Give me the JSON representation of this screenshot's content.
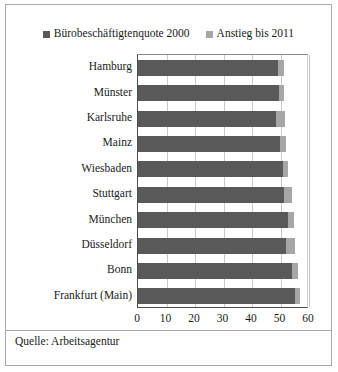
{
  "chart_data": {
    "type": "bar",
    "orientation": "horizontal",
    "stacked": true,
    "title": "",
    "xlabel": "",
    "ylabel": "",
    "xlim": [
      0,
      60
    ],
    "xticks": [
      0,
      10,
      20,
      30,
      40,
      50,
      60
    ],
    "xtick_labels": [
      "0",
      "10",
      "20",
      "30",
      "40",
      "50",
      "60"
    ],
    "grid": true,
    "grid_axis": "x",
    "legend_position": "top-center",
    "categories": [
      "Hamburg",
      "Münster",
      "Karlsruhe",
      "Mainz",
      "Wiesbaden",
      "Stuttgart",
      "München",
      "Düsseldorf",
      "Bonn",
      "Frankfurt (Main)"
    ],
    "series": [
      {
        "name": "Bürobeschäftigtenquote 2000",
        "color": "#595959",
        "values": [
          49.1,
          49.5,
          48.4,
          49.8,
          50.9,
          51.2,
          52.6,
          51.9,
          54.0,
          55.1
        ]
      },
      {
        "name": "Anstieg bis 2011",
        "color": "#a6a6a6",
        "values": [
          2.1,
          1.8,
          3.2,
          2.1,
          1.8,
          2.8,
          2.1,
          3.2,
          2.1,
          1.8
        ]
      }
    ],
    "totals": [
      51.2,
      51.3,
      51.6,
      51.9,
      52.7,
      54.0,
      54.7,
      55.1,
      56.1,
      56.9
    ]
  },
  "legend": {
    "items": [
      {
        "label": "Bürobeschäftigtenquote 2000",
        "swatch_color": "#595959"
      },
      {
        "label": "Anstieg bis 2011",
        "swatch_color": "#a6a6a6"
      }
    ]
  },
  "source": {
    "text": "Quelle: Arbeitsagentur"
  }
}
